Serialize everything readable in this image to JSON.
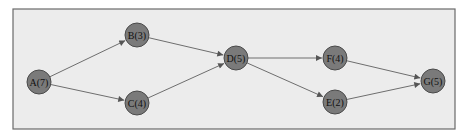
{
  "diagram": {
    "type": "activity-network",
    "nodes": [
      {
        "id": "A",
        "label": "A(7)",
        "x": 39,
        "y": 82
      },
      {
        "id": "B",
        "label": "B(3)",
        "x": 137,
        "y": 35
      },
      {
        "id": "C",
        "label": "C(4)",
        "x": 137,
        "y": 103
      },
      {
        "id": "D",
        "label": "D(5)",
        "x": 236,
        "y": 58
      },
      {
        "id": "F",
        "label": "F(4)",
        "x": 335,
        "y": 58
      },
      {
        "id": "E",
        "label": "E(2)",
        "x": 335,
        "y": 102
      },
      {
        "id": "G",
        "label": "G(5)",
        "x": 433,
        "y": 81
      }
    ],
    "edges": [
      {
        "from": "A",
        "to": "B"
      },
      {
        "from": "A",
        "to": "C"
      },
      {
        "from": "B",
        "to": "D"
      },
      {
        "from": "C",
        "to": "D"
      },
      {
        "from": "D",
        "to": "F"
      },
      {
        "from": "D",
        "to": "E"
      },
      {
        "from": "F",
        "to": "G"
      },
      {
        "from": "E",
        "to": "G"
      }
    ],
    "colors": {
      "background": "#ececec",
      "node_fill": "#7a7a7a",
      "edge": "#6e6e6e",
      "frame": "#6a6a6a"
    }
  }
}
